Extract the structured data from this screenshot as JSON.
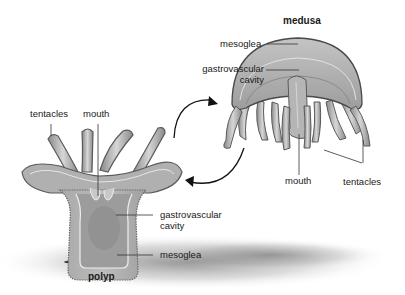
{
  "diagram": {
    "colors": {
      "body_fill": "#b3b3b3",
      "body_light": "#cfcfcf",
      "body_dark": "#7d7d7d",
      "outline": "#5a5a5a",
      "arrow": "#111111",
      "leader": "#333333",
      "shadow": "#8a8a8a"
    },
    "medusa": {
      "title": "medusa",
      "labels": {
        "mesoglea": "mesoglea",
        "gastro_line1": "gastrovascular",
        "gastro_line2": "cavity",
        "mouth": "mouth",
        "tentacles": "tentacles"
      }
    },
    "polyp": {
      "title": "polyp",
      "labels": {
        "tentacles": "tentacles",
        "mouth": "mouth",
        "gastro_line1": "gastrovascular",
        "gastro_line2": "cavity",
        "mesoglea": "mesoglea"
      }
    },
    "cycle_arrows": [
      {
        "from": "polyp",
        "to": "medusa"
      },
      {
        "from": "medusa",
        "to": "polyp"
      }
    ]
  }
}
